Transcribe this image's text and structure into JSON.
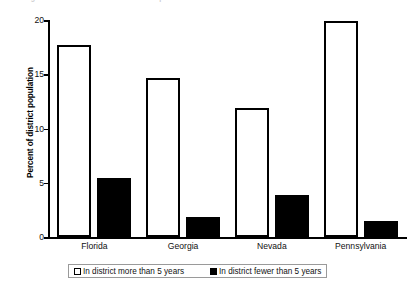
{
  "chart_data": {
    "type": "bar",
    "title": "",
    "subtitle": "",
    "xlabel": "",
    "ylabel": "Percent of district population",
    "ylim": [
      0,
      20
    ],
    "yticks": [
      0,
      5,
      10,
      15,
      20
    ],
    "ytick_labels": [
      "0",
      "5",
      "10",
      "15",
      "20"
    ],
    "grid": false,
    "legend_position": "bottom",
    "categories": [
      "Florida",
      "Georgia",
      "Nevada",
      "Pennsylvania"
    ],
    "series": [
      {
        "name": "In district more than 5 years",
        "style": "open",
        "color": "#ffffff",
        "edge_color": "#000000",
        "values": [
          17.7,
          14.7,
          11.9,
          19.9
        ]
      },
      {
        "name": "In district fewer than 5 years",
        "style": "filled",
        "color": "#000000",
        "edge_color": "#000000",
        "values": [
          5.4,
          1.8,
          3.9,
          1.5
        ]
      }
    ]
  },
  "legend": {
    "entries": [
      {
        "label": "In district more than 5 years"
      },
      {
        "label": "In district fewer than 5 years"
      }
    ]
  },
  "caption_sliver": {
    "text": "figure continues above the visible crop"
  },
  "colors": {
    "axis": "#000000",
    "open_bar_fill": "#ffffff",
    "filled_bar_fill": "#000000",
    "legend_border": "#9a9a9a",
    "text": "#111111"
  }
}
